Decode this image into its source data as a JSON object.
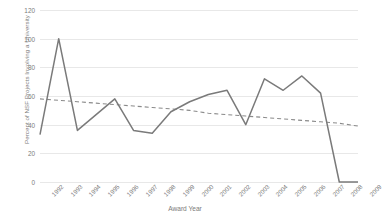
{
  "chart_data": {
    "type": "line",
    "title": "",
    "xlabel": "Award Year",
    "ylabel": "Percent of NSF Projects Involving a University",
    "categories": [
      "1992",
      "1993",
      "1994",
      "1995",
      "1996",
      "1997",
      "1998",
      "1999",
      "2000",
      "2001",
      "2002",
      "2003",
      "2004",
      "2005",
      "2006",
      "2007",
      "2008",
      "2009"
    ],
    "ylim": [
      0,
      120
    ],
    "yticks": [
      0,
      20,
      40,
      60,
      80,
      100,
      120
    ],
    "ytick_labels": [
      "0",
      "20",
      "40",
      "60",
      "80",
      "100",
      "120"
    ],
    "grid": true,
    "legend": "none",
    "series": [
      {
        "name": "Percent of NSF Projects Involving a University",
        "style": "solid",
        "color": "#7a7a7a",
        "values": [
          33,
          100,
          36,
          47,
          58,
          36,
          34,
          49,
          56,
          61,
          64,
          40,
          72,
          64,
          74,
          62,
          0,
          0
        ]
      },
      {
        "name": "Linear trendline",
        "style": "dashed",
        "color": "#8a8a8a",
        "values": [
          58,
          57,
          56,
          55,
          54,
          53,
          52,
          51,
          50,
          48,
          47,
          46,
          45,
          44,
          43,
          42,
          41,
          39
        ]
      }
    ]
  },
  "axes": {
    "y_title": "Percent of NSF Projects Involving a University",
    "x_title": "Award Year"
  },
  "colors": {
    "series_line": "#7a7a7a",
    "trend_line": "#8a8a8a",
    "gridline": "#e8e8e8",
    "text": "#7b7b7b",
    "background": "#ffffff"
  }
}
